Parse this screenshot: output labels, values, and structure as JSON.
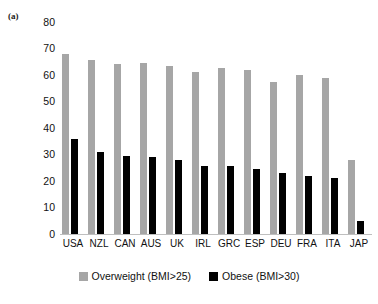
{
  "panel": {
    "label": "(a)"
  },
  "chart_data": {
    "type": "bar",
    "title": "",
    "subtitle": "",
    "xlabel": "",
    "ylabel": "",
    "ylim": [
      0,
      80
    ],
    "yticks": [
      0,
      10,
      20,
      30,
      40,
      50,
      60,
      70,
      80
    ],
    "grid": false,
    "legend_position": "bottom",
    "categories": [
      "USA",
      "NZL",
      "CAN",
      "AUS",
      "UK",
      "IRL",
      "GRC",
      "ESP",
      "DEU",
      "FRA",
      "ITA",
      "JAP"
    ],
    "series": [
      {
        "name": "Overweight (BMI>25)",
        "color": "#a6a6a6",
        "values": [
          68,
          65.5,
          64,
          64.5,
          63.5,
          61,
          62.5,
          62,
          57.5,
          60,
          59,
          28
        ]
      },
      {
        "name": "Obese (BMI>30)",
        "color": "#000000",
        "values": [
          36,
          31,
          29.5,
          29,
          28,
          25.5,
          25.5,
          24.5,
          23,
          22,
          21,
          5
        ]
      }
    ]
  }
}
